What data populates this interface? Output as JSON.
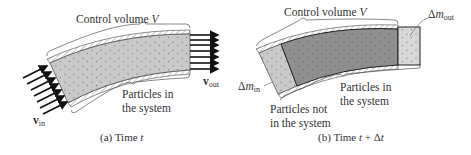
{
  "panel_a": {
    "control_volume_label": "Control volume ",
    "control_volume_symbol": "V",
    "particles_label_line1": "Particles in",
    "particles_label_line2": "the system",
    "v_in_symbol": "v",
    "v_in_sub": "in",
    "v_out_symbol": "v",
    "v_out_sub": "out",
    "caption_prefix": "(a) Time ",
    "caption_var": "t"
  },
  "panel_b": {
    "control_volume_label": "Control volume ",
    "control_volume_symbol": "V",
    "dm_in_prefix": "Δ",
    "dm_in_var": "m",
    "dm_in_sub": "in",
    "dm_out_prefix": "Δ",
    "dm_out_var": "m",
    "dm_out_sub": "out",
    "particles_in_line1": "Particles in",
    "particles_in_line2": "the system",
    "particles_not_line1": "Particles not",
    "particles_not_line2": "in the system",
    "caption_prefix": "(b) Time ",
    "caption_var": "t",
    "caption_suffix": " + Δ",
    "caption_var2": "t"
  },
  "colors": {
    "fluid_light": "#c9c9c9",
    "fluid_dark": "#8f8f8f",
    "fluid_out": "#d8d8d8",
    "wall": "#444444",
    "arrow": "#111111"
  }
}
